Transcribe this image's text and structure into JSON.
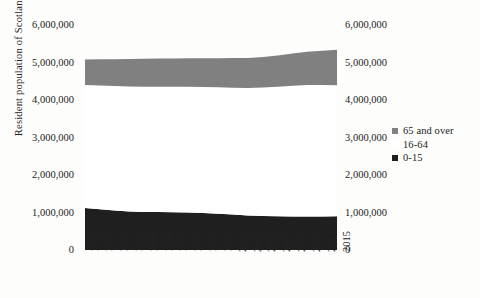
{
  "chart_data": {
    "type": "area",
    "stacked": true,
    "title": "",
    "xlabel": "",
    "ylabel": "Resident population of Scotland",
    "ylim": [
      0,
      6000000
    ],
    "ytick_labels": [
      "6,000,000",
      "5,000,000",
      "4,000,000",
      "3,000,000",
      "2,000,000",
      "1,000,000",
      "0"
    ],
    "ytick_values": [
      6000000,
      5000000,
      4000000,
      3000000,
      2000000,
      1000000,
      0
    ],
    "grid": false,
    "legend_position": "right",
    "x": [
      1981,
      1983,
      1985,
      1987,
      1989,
      1991,
      1993,
      1995,
      1997,
      1999,
      2001,
      2003,
      2005,
      2007,
      2009,
      2011,
      2013,
      2015
    ],
    "categories": [
      "1981",
      "1983",
      "1985",
      "1987",
      "1989",
      "1991",
      "1993",
      "1995",
      "1997",
      "1999",
      "2001",
      "2003",
      "2005",
      "2007",
      "2009",
      "2011",
      "2013",
      "2015"
    ],
    "series": [
      {
        "name": "0-15",
        "color": "#1f1f1f",
        "values": [
          1117000,
          1085000,
          1053000,
          1030000,
          1016000,
          1012000,
          1008000,
          1001000,
          987000,
          968000,
          945000,
          923000,
          908000,
          899000,
          896000,
          893000,
          894000,
          900000
        ]
      },
      {
        "name": "16-64",
        "color": "#ffffff",
        "values": [
          3285000,
          3300000,
          3318000,
          3330000,
          3338000,
          3341000,
          3345000,
          3351000,
          3360000,
          3372000,
          3385000,
          3400000,
          3425000,
          3455000,
          3484000,
          3507000,
          3506000,
          3494000
        ]
      },
      {
        "name": "65 and over",
        "color": "#808080",
        "values": [
          678000,
          700000,
          719000,
          733000,
          744000,
          752000,
          757000,
          762000,
          768000,
          776000,
          787000,
          800000,
          816000,
          836000,
          859000,
          885000,
          916000,
          947000
        ]
      }
    ],
    "totals": [
      5080000,
      5085000,
      5090000,
      5093000,
      5098000,
      5105000,
      5110000,
      5114000,
      5115000,
      5116000,
      5117000,
      5123000,
      5149000,
      5190000,
      5239000,
      5285000,
      5316000,
      5341000
    ]
  },
  "legend": {
    "items": [
      {
        "label": "65 and over",
        "color": "#808080"
      },
      {
        "label": "16-64",
        "color": "#ffffff"
      },
      {
        "label": "0-15",
        "color": "#1f1f1f"
      }
    ]
  },
  "axes": {
    "y_title": "Resident population of Scotland",
    "y_labels_left": [
      "6,000,000",
      "5,000,000",
      "4,000,000",
      "3,000,000",
      "2,000,000",
      "1,000,000",
      "0"
    ],
    "y_labels_right": [
      "6,000,000",
      "5,000,000",
      "4,000,000",
      "3,000,000",
      "2,000,000",
      "1,000,000",
      "0"
    ],
    "x_labels": [
      "1981",
      "1983",
      "1985",
      "1987",
      "1989",
      "1991",
      "1993",
      "1995",
      "1997",
      "1999",
      "2001",
      "2003",
      "2005",
      "2007",
      "2009",
      "2011",
      "2013",
      "2015"
    ]
  }
}
